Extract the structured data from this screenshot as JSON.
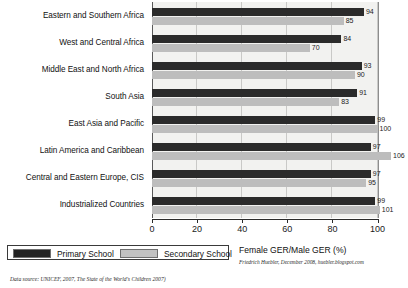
{
  "chart_data": {
    "type": "bar",
    "orientation": "horizontal",
    "title": "",
    "xlabel": "Female GER/Male GER (%)",
    "ylabel": "",
    "xlim": [
      0,
      110
    ],
    "xticks": [
      0,
      20,
      40,
      60,
      80,
      100
    ],
    "grid": true,
    "legend_position": "bottom-left",
    "categories": [
      "Eastern and Southern Africa",
      "West and Central Africa",
      "Middle East and North Africa",
      "South Asia",
      "East Asia and Pacific",
      "Latin America and Caribbean",
      "Central and Eastern Europe, CIS",
      "Industrialized Countries"
    ],
    "series": [
      {
        "name": "Primary School",
        "color": "#2b2b2b",
        "values": [
          94,
          84,
          93,
          91,
          99,
          97,
          97,
          99
        ]
      },
      {
        "name": "Secondary School",
        "color": "#bdbdbd",
        "values": [
          85,
          70,
          90,
          83,
          100,
          106,
          95,
          101
        ]
      }
    ]
  },
  "legend": {
    "items": [
      {
        "label": "Primary School",
        "swatch": "primary"
      },
      {
        "label": "Secondary School",
        "swatch": "secondary"
      }
    ]
  },
  "axis_title": "Female GER/Male GER (%)",
  "credit": "Friedrich Huebler, December 2008, huebler.blogspot.com",
  "source_note": "Data source: UNICEF, 2007, The State of the World's Children 2007)"
}
